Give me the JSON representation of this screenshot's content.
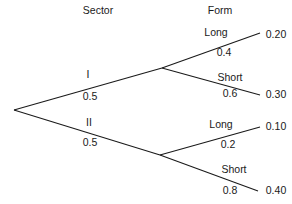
{
  "diagram": {
    "title_headers": {
      "sector": "Sector",
      "form": "Form"
    },
    "root": {
      "label": ""
    },
    "branches": [
      {
        "name": "I",
        "probability": "0.5",
        "children": [
          {
            "name": "Long",
            "probability": "0.4",
            "joint": "0.20"
          },
          {
            "name": "Short",
            "probability": "0.6",
            "joint": "0.30"
          }
        ]
      },
      {
        "name": "II",
        "probability": "0.5",
        "children": [
          {
            "name": "Long",
            "probability": "0.2",
            "joint": "0.10"
          },
          {
            "name": "Short",
            "probability": "0.8",
            "joint": "0.40"
          }
        ]
      }
    ],
    "colors": {
      "line": "#1a1a1a",
      "text": "#1a1a1a",
      "background": "#ffffff"
    }
  }
}
